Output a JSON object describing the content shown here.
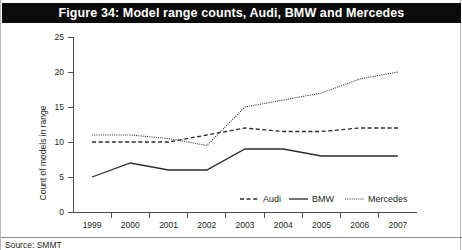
{
  "figure": {
    "title": "Figure 34: Model range counts, Audi, BMW and Mercedes",
    "source": "Source: SMMT"
  },
  "axes": {
    "y_title": "Count of models in range",
    "y_ticks": [
      "0",
      "5",
      "10",
      "15",
      "20",
      "25"
    ],
    "x_ticks": [
      "1999",
      "2000",
      "2001",
      "2002",
      "2003",
      "2004",
      "2005",
      "2006",
      "2007"
    ]
  },
  "legend": {
    "position": "bottom-right-inside-plot",
    "entries": [
      {
        "label": "Audi",
        "style": "dashed"
      },
      {
        "label": "BMW",
        "style": "solid"
      },
      {
        "label": "Mercedes",
        "style": "dotted"
      }
    ]
  },
  "colors": {
    "banner_background": "#0b0b0b",
    "banner_text": "#ffffff",
    "line": "#2b2b2b",
    "axis": "#4d4d4d",
    "page_background": "#ffffff"
  },
  "chart_data": {
    "type": "line",
    "title": "Figure 34: Model range counts, Audi, BMW and Mercedes",
    "xlabel": "",
    "ylabel": "Count of models in range",
    "categories": [
      "1999",
      "2000",
      "2001",
      "2002",
      "2003",
      "2004",
      "2005",
      "2006",
      "2007"
    ],
    "ylim": [
      0,
      25
    ],
    "yticks": [
      0,
      5,
      10,
      15,
      20,
      25
    ],
    "grid": false,
    "legend": "inside bottom right",
    "series": [
      {
        "name": "Audi",
        "style": "dashed",
        "values": [
          10,
          10,
          10,
          11,
          12,
          11.5,
          11.5,
          12,
          12
        ]
      },
      {
        "name": "BMW",
        "style": "solid",
        "values": [
          5,
          7,
          6,
          6,
          9,
          9,
          8,
          8,
          8
        ]
      },
      {
        "name": "Mercedes",
        "style": "dotted",
        "values": [
          11,
          11,
          10.5,
          9.5,
          15,
          16,
          17,
          19,
          20
        ]
      }
    ]
  }
}
